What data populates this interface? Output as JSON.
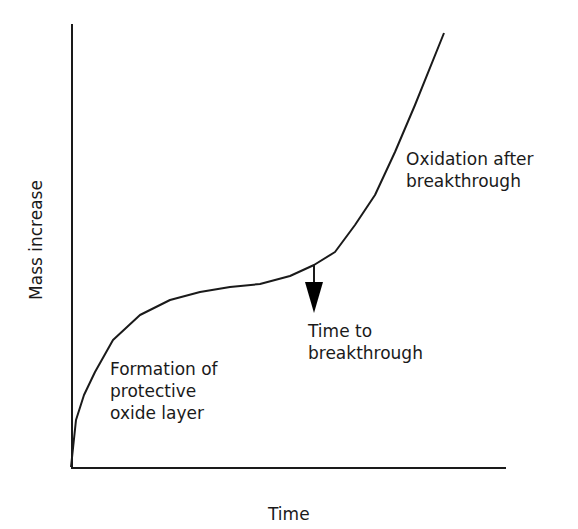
{
  "chart_data": {
    "type": "line",
    "title": "",
    "xlabel": "Time",
    "ylabel": "Mass increase",
    "grid": false,
    "legend": null,
    "series": [
      {
        "name": "Mass increase vs time (oxidation)",
        "points_px": [
          [
            71,
            467
          ],
          [
            76,
            420
          ],
          [
            84,
            395
          ],
          [
            95,
            372
          ],
          [
            113,
            340
          ],
          [
            140,
            315
          ],
          [
            170,
            300
          ],
          [
            200,
            292
          ],
          [
            230,
            287
          ],
          [
            260,
            284
          ],
          [
            290,
            276
          ],
          [
            314,
            265
          ],
          [
            335,
            252
          ],
          [
            355,
            225
          ],
          [
            375,
            195
          ],
          [
            395,
            152
          ],
          [
            415,
            105
          ],
          [
            444,
            33
          ]
        ]
      }
    ],
    "annotations": [
      {
        "text": "Formation of protective oxide layer",
        "lines": [
          "Formation of",
          "protective",
          "oxide layer"
        ]
      },
      {
        "text": "Time to breakthrough",
        "lines": [
          "Time to",
          "breakthrough"
        ],
        "arrow": "down, from curve at breakthrough point"
      },
      {
        "text": "Oxidation after breakthrough",
        "lines": [
          "Oxidation after",
          "breakthrough"
        ]
      }
    ]
  },
  "axes": {
    "x_label": "Time",
    "y_label": "Mass increase"
  },
  "labels": {
    "formation": [
      "Formation of",
      "protective",
      "oxide layer"
    ],
    "breakthrough": [
      "Time to",
      "breakthrough"
    ],
    "after": [
      "Oxidation after",
      "breakthrough"
    ]
  }
}
